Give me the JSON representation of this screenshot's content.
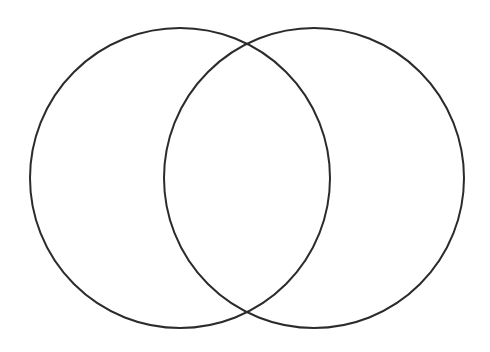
{
  "canvas": {
    "width": 490,
    "height": 352,
    "background_color": "#FFFFFF"
  },
  "diagram": {
    "type": "venn-diagram",
    "set_count": 2,
    "title": "",
    "stroke_color": "#2B2B2B",
    "stroke_width": 2,
    "fill_color": "none",
    "circles": [
      {
        "id": "left-circle",
        "label": "",
        "center_x": 180,
        "center_y": 178,
        "radius": 150
      },
      {
        "id": "right-circle",
        "label": "",
        "center_x": 314,
        "center_y": 178,
        "radius": 150
      }
    ],
    "intersection": {
      "top_point_x": 247,
      "top_point_y": 41,
      "bottom_point_x": 247,
      "bottom_point_y": 315,
      "label": ""
    },
    "regions": [
      {
        "id": "left-only",
        "label": "",
        "center_x": 110,
        "center_y": 178
      },
      {
        "id": "overlap",
        "label": "",
        "center_x": 247,
        "center_y": 178
      },
      {
        "id": "right-only",
        "label": "",
        "center_x": 384,
        "center_y": 178
      }
    ],
    "labels": {
      "left_set_label": "",
      "right_set_label": "",
      "overlap_label": ""
    }
  }
}
